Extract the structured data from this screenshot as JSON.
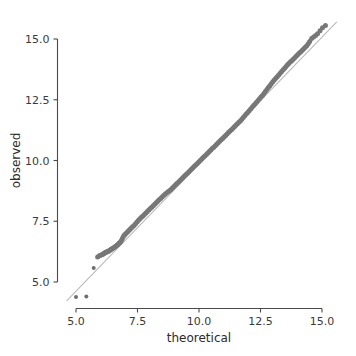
{
  "chart_data": {
    "type": "scatter",
    "title": "",
    "subtitle": "",
    "xlabel": "theoretical",
    "ylabel": "observed",
    "xlim": [
      4.55,
      15.7
    ],
    "ylim": [
      4.15,
      15.75
    ],
    "xticks": [
      5.0,
      7.5,
      10.0,
      12.5,
      15.0
    ],
    "yticks": [
      5.0,
      7.5,
      10.0,
      12.5,
      15.0
    ],
    "xtick_labels": [
      "5.0",
      "7.5",
      "10.0",
      "12.5",
      "15.0"
    ],
    "ytick_labels": [
      "5.0",
      "7.5",
      "10.0",
      "12.5",
      "15.0"
    ],
    "grid": false,
    "legend": null,
    "point_color": "#777777",
    "reference_line_color": "#b9b9b9",
    "axis_color": "#4a4a4a",
    "reference_line": {
      "label": "identity line",
      "x": [
        4.62,
        15.6
      ],
      "y": [
        4.22,
        15.7
      ]
    },
    "series": [
      {
        "name": "sample quantiles",
        "marker": "circle",
        "x": [
          5.0,
          5.42,
          5.72,
          5.88,
          5.95,
          6.0,
          6.05,
          6.09,
          6.12,
          6.15,
          6.18,
          6.21,
          6.24,
          6.27,
          6.3,
          6.33,
          6.36,
          6.39,
          6.42,
          6.45,
          6.48,
          6.52,
          6.56,
          6.6,
          6.64,
          6.68,
          6.72,
          6.76,
          6.8,
          6.84,
          6.88,
          6.92,
          6.96,
          7.0,
          7.05,
          7.1,
          7.15,
          7.2,
          7.25,
          7.3,
          7.36,
          7.42,
          7.48,
          7.54,
          7.6,
          7.66,
          7.72,
          7.78,
          7.84,
          7.9,
          7.96,
          8.02,
          8.08,
          8.14,
          8.2,
          8.26,
          8.32,
          8.38,
          8.44,
          8.5,
          8.56,
          8.62,
          8.68,
          8.74,
          8.8,
          8.86,
          8.92,
          8.98,
          9.04,
          9.1,
          9.16,
          9.22,
          9.28,
          9.34,
          9.4,
          9.46,
          9.52,
          9.58,
          9.64,
          9.7,
          9.76,
          9.82,
          9.88,
          9.94,
          10.0,
          10.06,
          10.12,
          10.18,
          10.24,
          10.3,
          10.36,
          10.42,
          10.48,
          10.54,
          10.6,
          10.66,
          10.72,
          10.78,
          10.84,
          10.9,
          10.96,
          11.02,
          11.08,
          11.14,
          11.2,
          11.26,
          11.32,
          11.38,
          11.44,
          11.5,
          11.56,
          11.62,
          11.68,
          11.74,
          11.8,
          11.86,
          11.92,
          11.98,
          12.04,
          12.1,
          12.16,
          12.22,
          12.28,
          12.34,
          12.4,
          12.46,
          12.52,
          12.58,
          12.64,
          12.7,
          12.76,
          12.82,
          12.88,
          12.94,
          13.0,
          13.06,
          13.12,
          13.18,
          13.24,
          13.3,
          13.36,
          13.42,
          13.48,
          13.54,
          13.6,
          13.66,
          13.72,
          13.78,
          13.84,
          13.9,
          13.96,
          14.02,
          14.08,
          14.14,
          14.2,
          14.26,
          14.32,
          14.38,
          14.44,
          14.5,
          14.58,
          14.66,
          14.74,
          14.82,
          14.92,
          15.02,
          15.14
        ],
        "y": [
          4.38,
          4.4,
          5.58,
          6.03,
          6.08,
          6.1,
          6.12,
          6.14,
          6.16,
          6.18,
          6.2,
          6.22,
          6.23,
          6.25,
          6.26,
          6.28,
          6.3,
          6.32,
          6.34,
          6.36,
          6.38,
          6.4,
          6.43,
          6.46,
          6.49,
          6.52,
          6.56,
          6.6,
          6.64,
          6.7,
          6.78,
          6.86,
          6.92,
          6.97,
          7.02,
          7.07,
          7.12,
          7.17,
          7.22,
          7.27,
          7.33,
          7.4,
          7.47,
          7.54,
          7.6,
          7.66,
          7.72,
          7.78,
          7.84,
          7.9,
          7.96,
          8.02,
          8.08,
          8.14,
          8.2,
          8.26,
          8.32,
          8.38,
          8.44,
          8.5,
          8.56,
          8.61,
          8.66,
          8.71,
          8.76,
          8.81,
          8.87,
          8.93,
          8.99,
          9.05,
          9.11,
          9.17,
          9.23,
          9.29,
          9.35,
          9.41,
          9.47,
          9.53,
          9.59,
          9.65,
          9.71,
          9.77,
          9.83,
          9.89,
          9.95,
          10.01,
          10.07,
          10.13,
          10.19,
          10.25,
          10.31,
          10.37,
          10.43,
          10.49,
          10.55,
          10.61,
          10.67,
          10.73,
          10.79,
          10.85,
          10.91,
          10.97,
          11.03,
          11.09,
          11.15,
          11.21,
          11.27,
          11.33,
          11.39,
          11.45,
          11.51,
          11.57,
          11.63,
          11.7,
          11.77,
          11.84,
          11.91,
          11.98,
          12.05,
          12.12,
          12.19,
          12.26,
          12.33,
          12.4,
          12.47,
          12.54,
          12.61,
          12.68,
          12.76,
          12.84,
          12.92,
          13.0,
          13.08,
          13.16,
          13.24,
          13.31,
          13.38,
          13.45,
          13.52,
          13.59,
          13.66,
          13.73,
          13.8,
          13.87,
          13.94,
          14.0,
          14.06,
          14.12,
          14.18,
          14.24,
          14.3,
          14.36,
          14.42,
          14.48,
          14.54,
          14.6,
          14.66,
          14.72,
          14.8,
          14.9,
          15.02,
          15.08,
          15.14,
          15.22,
          15.34,
          15.46,
          15.56
        ]
      }
    ],
    "annotations": [
      {
        "text": "two low outliers fall below the identity line",
        "x": 5.2,
        "y": 4.4
      },
      {
        "text": "upper tail bends above the identity line",
        "x": 14.5,
        "y": 15.1
      }
    ]
  }
}
